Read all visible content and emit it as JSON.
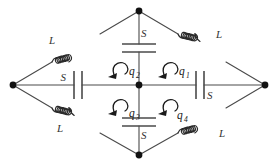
{
  "figure": {
    "background_color": "#ffffff",
    "wire_color": "#4a4a4a",
    "label_color": "#333333",
    "node_color": "#111111"
  },
  "nodes": [
    {
      "id": "top",
      "label": "top-node",
      "x": 139,
      "y": 11
    },
    {
      "id": "left",
      "label": "left-node",
      "x": 13,
      "y": 85
    },
    {
      "id": "right",
      "label": "right-node",
      "x": 265,
      "y": 85
    },
    {
      "id": "bottom",
      "label": "bottom-node",
      "x": 139,
      "y": 155
    },
    {
      "id": "center",
      "label": "center-node",
      "x": 139,
      "y": 85
    }
  ],
  "inductors": [
    {
      "id": "L-top-left",
      "label": "L",
      "position": "top-left-branch"
    },
    {
      "id": "L-top-right",
      "label": "L",
      "position": "top-right-branch"
    },
    {
      "id": "L-bottom-left",
      "label": "L",
      "position": "bottom-left-branch"
    },
    {
      "id": "L-bottom-right",
      "label": "L",
      "position": "bottom-right-branch"
    }
  ],
  "capacitors": [
    {
      "id": "S-top",
      "label": "S",
      "orientation": "horizontal-plates",
      "position": "top-center-branch"
    },
    {
      "id": "S-left",
      "label": "S",
      "orientation": "vertical-plates",
      "position": "left-center-branch"
    },
    {
      "id": "S-right",
      "label": "S",
      "orientation": "vertical-plates",
      "position": "right-center-branch"
    },
    {
      "id": "S-bottom",
      "label": "S",
      "orientation": "horizontal-plates",
      "position": "bottom-center-branch"
    }
  ],
  "mesh_charges": [
    {
      "id": "q1",
      "base": "q",
      "subscript": "1",
      "quadrant": "upper-right",
      "arrow_direction": "counterclockwise"
    },
    {
      "id": "q2",
      "base": "q",
      "subscript": "2",
      "quadrant": "upper-left",
      "arrow_direction": "counterclockwise"
    },
    {
      "id": "q3",
      "base": "q",
      "subscript": "3",
      "quadrant": "lower-left",
      "arrow_direction": "counterclockwise"
    },
    {
      "id": "q4",
      "base": "q",
      "subscript": "4",
      "quadrant": "lower-right",
      "arrow_direction": "counterclockwise"
    }
  ]
}
